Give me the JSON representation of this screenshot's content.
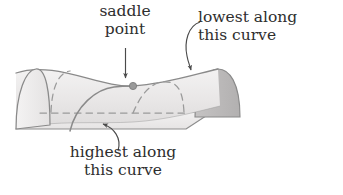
{
  "figure": {
    "background_color": "#ffffff",
    "surface": {
      "name": "hyperbolic-paraboloid",
      "fill_light": "#eceaea",
      "fill_dark": "#b9b7b7",
      "outline_color": "#8a8a8a",
      "dashed_color": "#9a9a9a",
      "base_fill": "#efeeee"
    },
    "saddle_point": {
      "x": 133,
      "y": 86,
      "radius": 3.6,
      "color": "#9a9a9a"
    }
  },
  "labels": {
    "saddle": "saddle\npoint",
    "saddle_line1": "saddle",
    "saddle_line2": "point",
    "lowest_line1": "lowest along",
    "lowest_line2": "this curve",
    "highest_line1": "highest along",
    "highest_line2": "this curve"
  },
  "annotations": [
    {
      "id": "saddle-point-annotation",
      "text": "saddle point",
      "leader": "straight-arrow-down",
      "points_to": "saddle point at center of surface"
    },
    {
      "id": "lowest-curve-annotation",
      "text": "lowest along this curve",
      "leader": "curved-arrow",
      "points_to": "top ridge valley curve"
    },
    {
      "id": "highest-curve-annotation",
      "text": "highest along this curve",
      "leader": "curved-arrow",
      "points_to": "front arch curve"
    }
  ],
  "text_color": "#2e2e2e"
}
